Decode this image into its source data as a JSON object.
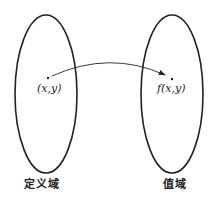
{
  "diagram": {
    "domain_set": {
      "label": "定义域",
      "point_label": "(x,y)"
    },
    "range_set": {
      "label": "值域",
      "point_label": "f(x,y)"
    },
    "mapping_arrow": {
      "from": "(x,y)",
      "to": "f(x,y)"
    },
    "colors": {
      "stroke": "#222222",
      "background": "#ffffff"
    }
  }
}
